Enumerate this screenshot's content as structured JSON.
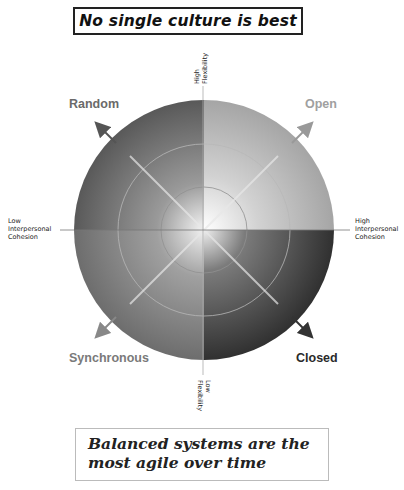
{
  "title": "No single culture is best",
  "footer": {
    "line1": "Balanced systems are the",
    "line2": "most agile over time"
  },
  "axes": {
    "top": {
      "line1": "High",
      "line2": "Flexibility"
    },
    "bottom": {
      "line1": "Low",
      "line2": "Flexibility"
    },
    "left": {
      "line1": "Low",
      "line2": "Interpersonal",
      "line3": "Cohesion"
    },
    "right": {
      "line1": "High",
      "line2": "Interpersonal",
      "line3": "Cohesion"
    }
  },
  "quadrants": {
    "top_left": {
      "label": "Random",
      "color": "#6e6e6e"
    },
    "top_right": {
      "label": "Open",
      "color": "#a8a8a8"
    },
    "bottom_left": {
      "label": "Synchronous",
      "color": "#7c7c7c"
    },
    "bottom_right": {
      "label": "Closed",
      "color": "#2a2a2a"
    }
  },
  "colors": {
    "random_shade": "#5a5a5a",
    "open_shade": "#b5b5b5",
    "synchronous_shade": "#7a7a7a",
    "closed_shade": "#3a3a3a"
  }
}
